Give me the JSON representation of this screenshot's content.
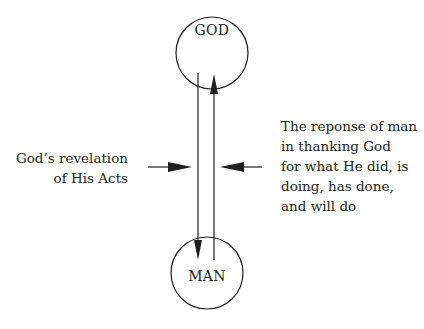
{
  "diagram": {
    "nodes": [
      {
        "id": "god",
        "label": "GOD"
      },
      {
        "id": "man",
        "label": "MAN"
      }
    ],
    "edges": [
      {
        "from": "god",
        "to": "man",
        "label_ref": "left_annotation"
      },
      {
        "from": "man",
        "to": "god",
        "label_ref": "right_annotation"
      }
    ],
    "left_annotation": {
      "lines": [
        "God’s revelation",
        "of His Acts"
      ]
    },
    "right_annotation": {
      "lines": [
        "The reponse of man",
        "in thanking God",
        "for what He did, is",
        "doing, has done,",
        "and will do"
      ]
    },
    "colors": {
      "stroke": "#231f20",
      "background": "#ffffff"
    }
  }
}
